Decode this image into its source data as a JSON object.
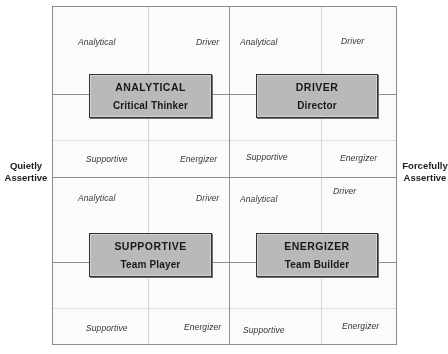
{
  "diagram": {
    "axis": {
      "left": {
        "line1": "Quietly",
        "line2": "Assertive"
      },
      "right": {
        "line1": "Forcefully",
        "line2": "Assertive"
      }
    },
    "quadrants": [
      {
        "id": "top-left",
        "box": {
          "title": "ANALYTICAL",
          "subtitle": "Critical Thinker"
        },
        "corner_labels": {
          "top_left": "Analytical",
          "top_right": "Driver",
          "bottom_left": "Supportive",
          "bottom_right": "Energizer"
        }
      },
      {
        "id": "top-right",
        "box": {
          "title": "DRIVER",
          "subtitle": "Director"
        },
        "corner_labels": {
          "top_left": "Analytical",
          "top_right": "Driver",
          "bottom_left": "Supportive",
          "bottom_right": "Energizer"
        }
      },
      {
        "id": "bottom-left",
        "box": {
          "title": "SUPPORTIVE",
          "subtitle": "Team Player"
        },
        "corner_labels": {
          "top_left": "Analytical",
          "top_right": "Driver",
          "bottom_left": "Supportive",
          "bottom_right": "Energizer"
        }
      },
      {
        "id": "bottom-right",
        "box": {
          "title": "ENERGIZER",
          "subtitle": "Team Builder"
        },
        "corner_labels": {
          "top_left": "Analytical",
          "top_right": "Driver",
          "bottom_left": "Supportive",
          "bottom_right": "Energizer"
        }
      }
    ],
    "colors": {
      "box_fill": "#b9b9b9",
      "box_border": "#2b2b2b",
      "grid_major": "#8d8d8d",
      "grid_minor": "#d6d6d6",
      "text": "#111111",
      "background": "#ffffff"
    }
  }
}
